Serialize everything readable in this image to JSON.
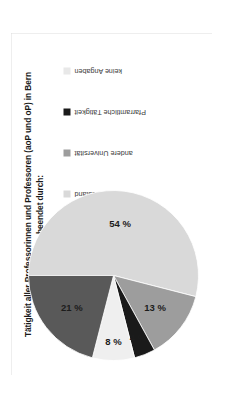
{
  "page": {
    "background": "#ffffff",
    "frame_color": "#dcdcdc"
  },
  "title": {
    "line1": "Tätigkeit aller Professorinnen und Professoren (aoP und oP) in Bern",
    "line2": "beendet durch:"
  },
  "legend": {
    "items": [
      {
        "label": "Tod",
        "color": "#7f7f7f"
      },
      {
        "label": "Ruhestand",
        "color": "#d9d9d9"
      },
      {
        "label": "andere Universität",
        "color": "#9d9d9d"
      },
      {
        "label": "Pfarramtliche Tätigkeit",
        "color": "#1a1a1a"
      },
      {
        "label": "keine Angaben",
        "color": "#e8e8e8"
      }
    ]
  },
  "chart_data": {
    "type": "pie",
    "title": "Tätigkeit aller Professorinnen und Professoren (aoP und oP) in Bern beendet durch:",
    "xlabel": "",
    "ylabel": "",
    "units": "percent",
    "legend_position": "top-right",
    "grid": false,
    "categories": [
      "Tod",
      "Ruhestand",
      "andere Universität",
      "Pfarramtliche Tätigkeit",
      "keine Angaben"
    ],
    "values": [
      21,
      54,
      13,
      4,
      8
    ],
    "labels": [
      "21 %",
      "54 %",
      "13 %",
      "4 %",
      "8 %"
    ],
    "colors": [
      "#595959",
      "#d9d9d9",
      "#9d9d9d",
      "#1a1a1a",
      "#efefef"
    ],
    "slices": [
      {
        "name": "Ruhestand",
        "value": 54,
        "label": "54 %",
        "color": "#d9d9d9"
      },
      {
        "name": "andere Universität",
        "value": 13,
        "label": "13 %",
        "color": "#9d9d9d"
      },
      {
        "name": "Pfarramtliche Tätigkeit",
        "value": 4,
        "label": "4 %",
        "color": "#1a1a1a"
      },
      {
        "name": "keine Angaben",
        "value": 8,
        "label": "8 %",
        "color": "#efefef"
      },
      {
        "name": "Tod",
        "value": 21,
        "label": "21 %",
        "color": "#595959"
      }
    ]
  }
}
